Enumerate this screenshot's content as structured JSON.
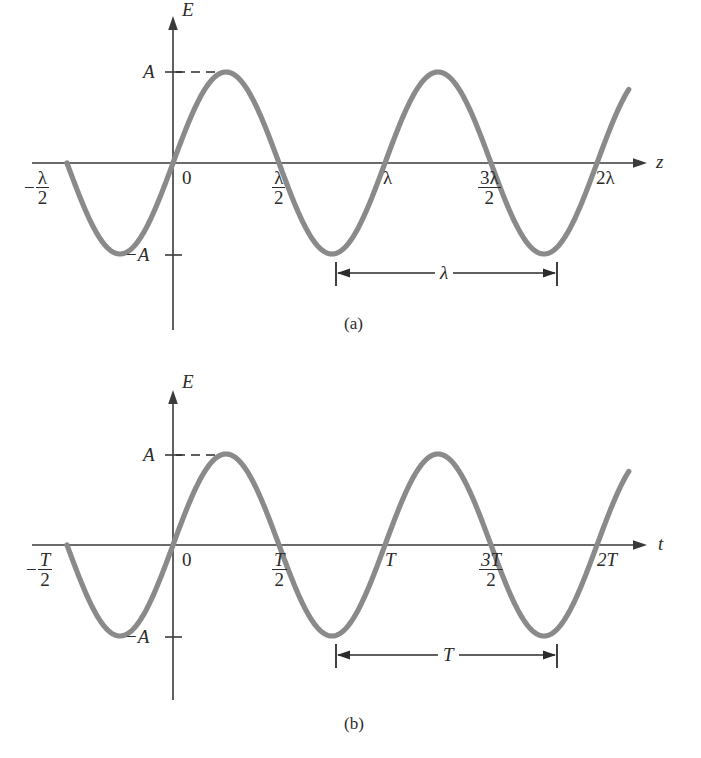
{
  "figure": {
    "background": "#ffffff",
    "curve_color": "#8a8a8a",
    "axis_color": "#3a3a3a",
    "text_color": "#2b2b2b"
  },
  "panels": [
    {
      "id": "a",
      "caption": "(a)",
      "y_axis_label": "E",
      "x_axis_label": "z",
      "amplitude_label": "A",
      "neg_amplitude_sign": "−",
      "neg_amplitude_label": "A",
      "origin_label": "0",
      "dimension_label": "λ",
      "ticks": [
        {
          "name": "neg-half-lambda",
          "sign": "−",
          "num": "λ",
          "den": "2",
          "kind": "fraction"
        },
        {
          "name": "origin",
          "text": "0",
          "kind": "plain"
        },
        {
          "name": "half-lambda",
          "num": "λ",
          "den": "2",
          "kind": "fraction"
        },
        {
          "name": "lambda",
          "text": "λ",
          "kind": "plain"
        },
        {
          "name": "three-half-lambda",
          "num": "3λ",
          "den": "2",
          "kind": "fraction"
        },
        {
          "name": "two-lambda",
          "text": "2λ",
          "kind": "plain"
        }
      ]
    },
    {
      "id": "b",
      "caption": "(b)",
      "y_axis_label": "E",
      "x_axis_label": "t",
      "amplitude_label": "A",
      "neg_amplitude_sign": "−",
      "neg_amplitude_label": "A",
      "origin_label": "0",
      "dimension_label": "T",
      "ticks": [
        {
          "name": "neg-half-period",
          "sign": "−",
          "num": "T",
          "den": "2",
          "kind": "fraction",
          "italic": true
        },
        {
          "name": "origin",
          "text": "0",
          "kind": "plain"
        },
        {
          "name": "half-period",
          "num": "T",
          "den": "2",
          "kind": "fraction",
          "italic": true
        },
        {
          "name": "period",
          "text": "T",
          "kind": "plain",
          "italic": true
        },
        {
          "name": "three-half-period",
          "num": "3T",
          "den": "2",
          "kind": "fraction",
          "italic": true
        },
        {
          "name": "two-period",
          "text": "2T",
          "kind": "plain",
          "italic": true
        }
      ]
    }
  ],
  "chart_data": [
    {
      "type": "line",
      "title": "(a) Electric field vs. position z",
      "xlabel": "z",
      "ylabel": "E",
      "function": "E = A sin(2*pi*z/lambda)",
      "amplitude": 1,
      "period_in_x": 1,
      "xlim": [
        -0.5,
        2.0
      ],
      "ylim": [
        -1.25,
        1.4
      ],
      "x_tick_values": [
        -0.5,
        0,
        0.5,
        1.0,
        1.5,
        2.0
      ],
      "x_tick_labels": [
        "-λ/2",
        "0",
        "λ/2",
        "λ",
        "3λ/2",
        "2λ"
      ],
      "y_tick_values": [
        1,
        -1
      ],
      "y_tick_labels": [
        "A",
        "-A"
      ],
      "grid": false,
      "legend": false,
      "annotations": [
        {
          "type": "dimension",
          "label": "λ",
          "from_x": 0.75,
          "to_x": 1.75,
          "at_y": -1.2
        },
        {
          "type": "dashed-guide",
          "label": "A",
          "from_x": 0,
          "to_x": 0.25,
          "at_y": 1
        }
      ]
    },
    {
      "type": "line",
      "title": "(b) Electric field vs. time t",
      "xlabel": "t",
      "ylabel": "E",
      "function": "E = A sin(2*pi*t/T)",
      "amplitude": 1,
      "period_in_x": 1,
      "xlim": [
        -0.5,
        2.0
      ],
      "ylim": [
        -1.25,
        1.4
      ],
      "x_tick_values": [
        -0.5,
        0,
        0.5,
        1.0,
        1.5,
        2.0
      ],
      "x_tick_labels": [
        "-T/2",
        "0",
        "T/2",
        "T",
        "3T/2",
        "2T"
      ],
      "y_tick_values": [
        1,
        -1
      ],
      "y_tick_labels": [
        "A",
        "-A"
      ],
      "grid": false,
      "legend": false,
      "annotations": [
        {
          "type": "dimension",
          "label": "T",
          "from_x": 0.75,
          "to_x": 1.75,
          "at_y": -1.2
        },
        {
          "type": "dashed-guide",
          "label": "A",
          "from_x": 0,
          "to_x": 0.25,
          "at_y": 1
        }
      ]
    }
  ]
}
